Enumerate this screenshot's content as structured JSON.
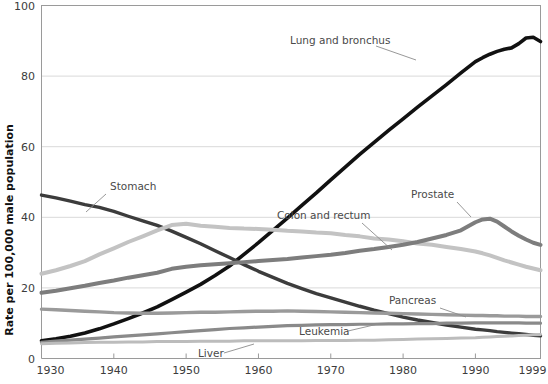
{
  "chart_data": {
    "type": "line",
    "title": "",
    "xlabel": "",
    "ylabel": "Rate per 100,000 male population",
    "xlim": [
      1930,
      1999
    ],
    "ylim": [
      0,
      100
    ],
    "grid": true,
    "legend_position": "inline-annotations",
    "xticks": [
      1930,
      1940,
      1950,
      1960,
      1970,
      1980,
      1990,
      1999
    ],
    "yticks": [
      0,
      20,
      40,
      60,
      80,
      100
    ],
    "x": [
      1930,
      1932,
      1934,
      1936,
      1938,
      1940,
      1942,
      1944,
      1946,
      1948,
      1950,
      1952,
      1954,
      1956,
      1958,
      1960,
      1962,
      1964,
      1966,
      1968,
      1970,
      1972,
      1974,
      1976,
      1978,
      1980,
      1982,
      1984,
      1986,
      1988,
      1990,
      1991,
      1992,
      1993,
      1994,
      1995,
      1996,
      1997,
      1998,
      1999
    ],
    "series": [
      {
        "name": "Lung and bronchus",
        "color": "#111111",
        "width": 3.6,
        "label_x": 1967,
        "label_y": 93,
        "values": [
          5.0,
          5.6,
          6.3,
          7.2,
          8.4,
          9.8,
          11.3,
          12.9,
          14.6,
          16.7,
          18.8,
          21.0,
          23.5,
          26.2,
          29.5,
          32.8,
          36.3,
          39.8,
          43.4,
          46.9,
          50.6,
          54.2,
          57.8,
          61.2,
          64.6,
          67.9,
          71.2,
          74.4,
          77.6,
          80.9,
          84.1,
          85.2,
          86.2,
          87.0,
          87.6,
          88.0,
          89.2,
          90.8,
          91.0,
          89.8
        ]
      },
      {
        "name": "Stomach",
        "color": "#3c3c3c",
        "width": 3.4,
        "label_x": 1936,
        "label_y": 51,
        "values": [
          46.3,
          45.5,
          44.6,
          43.6,
          42.8,
          41.7,
          40.3,
          39.0,
          37.7,
          36.1,
          34.3,
          32.5,
          30.5,
          28.6,
          26.6,
          24.7,
          23.0,
          21.3,
          19.8,
          18.4,
          17.2,
          16.0,
          14.8,
          13.7,
          12.7,
          11.7,
          10.9,
          10.2,
          9.5,
          8.9,
          8.3,
          8.1,
          7.9,
          7.6,
          7.4,
          7.2,
          7.0,
          6.8,
          6.6,
          6.4
        ]
      },
      {
        "name": "Colon and rectum",
        "color": "#c3c3c3",
        "width": 4.0,
        "label_x": 1958,
        "label_y": 45,
        "values": [
          24.0,
          25.0,
          26.2,
          27.6,
          29.5,
          31.2,
          33.0,
          34.6,
          36.3,
          37.8,
          38.2,
          37.6,
          37.3,
          37.0,
          36.8,
          36.7,
          36.5,
          36.2,
          36.0,
          35.7,
          35.5,
          35.0,
          34.6,
          34.0,
          33.7,
          33.2,
          32.6,
          32.2,
          31.6,
          31.0,
          30.3,
          29.8,
          29.2,
          28.5,
          27.8,
          27.2,
          26.6,
          26.0,
          25.5,
          25.0
        ]
      },
      {
        "name": "Prostate",
        "color": "#7d7d7d",
        "width": 4.0,
        "label_x": 1981,
        "label_y": 47,
        "values": [
          18.6,
          19.2,
          19.9,
          20.6,
          21.4,
          22.1,
          22.9,
          23.6,
          24.3,
          25.4,
          26.0,
          26.4,
          26.7,
          27.0,
          27.3,
          27.6,
          27.9,
          28.2,
          28.6,
          29.0,
          29.4,
          29.9,
          30.5,
          31.0,
          31.6,
          32.2,
          33.0,
          34.0,
          35.0,
          36.3,
          38.6,
          39.4,
          39.6,
          38.8,
          37.4,
          36.0,
          34.8,
          33.7,
          32.8,
          32.2
        ]
      },
      {
        "name": "Pancreas",
        "color": "#9a9a9a",
        "width": 3.4,
        "label_x": 1972,
        "label_y": 21.5,
        "values": [
          14.0,
          13.8,
          13.6,
          13.4,
          13.2,
          13.0,
          12.9,
          12.8,
          12.8,
          12.9,
          13.0,
          13.1,
          13.1,
          13.2,
          13.3,
          13.4,
          13.4,
          13.5,
          13.4,
          13.3,
          13.2,
          13.1,
          13.0,
          12.9,
          12.8,
          12.7,
          12.6,
          12.5,
          12.4,
          12.3,
          12.2,
          12.2,
          12.1,
          12.1,
          12.0,
          12.0,
          12.0,
          11.9,
          11.9,
          11.9
        ]
      },
      {
        "name": "Leukemia",
        "color": "#8a8a8a",
        "width": 3.2,
        "label_x": 1957,
        "label_y": 13.5,
        "values": [
          4.6,
          4.9,
          5.2,
          5.5,
          5.8,
          6.1,
          6.4,
          6.7,
          7.0,
          7.3,
          7.6,
          7.9,
          8.2,
          8.5,
          8.7,
          8.9,
          9.1,
          9.3,
          9.4,
          9.5,
          9.6,
          9.6,
          9.7,
          9.7,
          9.8,
          9.8,
          9.9,
          9.9,
          10.0,
          10.0,
          10.1,
          10.1,
          10.1,
          10.1,
          10.1,
          10.1,
          10.1,
          10.0,
          10.0,
          10.0
        ]
      },
      {
        "name": "Liver",
        "color": "#bcbcbc",
        "width": 3.0,
        "label_x": 1950,
        "label_y": 5.0,
        "values": [
          4.2,
          4.3,
          4.4,
          4.5,
          4.6,
          4.6,
          4.7,
          4.7,
          4.8,
          4.8,
          4.8,
          4.9,
          4.9,
          4.9,
          5.0,
          5.0,
          5.0,
          5.0,
          5.0,
          5.1,
          5.1,
          5.1,
          5.2,
          5.2,
          5.3,
          5.4,
          5.5,
          5.6,
          5.7,
          5.8,
          5.9,
          6.0,
          6.1,
          6.2,
          6.3,
          6.4,
          6.5,
          6.6,
          6.7,
          6.8
        ]
      }
    ],
    "annotations": [
      {
        "text": "Lung and bronchus",
        "x": 290,
        "y": 44,
        "leader": "M376,46 L416,60"
      },
      {
        "text": "Stomach",
        "x": 110,
        "y": 190,
        "leader": "M106,194 L86,212"
      },
      {
        "text": "Colon and rectum",
        "x": 277,
        "y": 219,
        "leader": "M362,223 L392,250"
      },
      {
        "text": "Prostate",
        "x": 411,
        "y": 198,
        "leader": "M457,202 L471,217"
      },
      {
        "text": "Pancreas",
        "x": 389,
        "y": 304,
        "leader": "M440,308 L466,317"
      },
      {
        "text": "Leukemia",
        "x": 299,
        "y": 335,
        "leader": "M348,331 L378,324"
      },
      {
        "text": "Liver",
        "x": 198,
        "y": 357,
        "leader": "M224,353 L254,344"
      }
    ]
  }
}
